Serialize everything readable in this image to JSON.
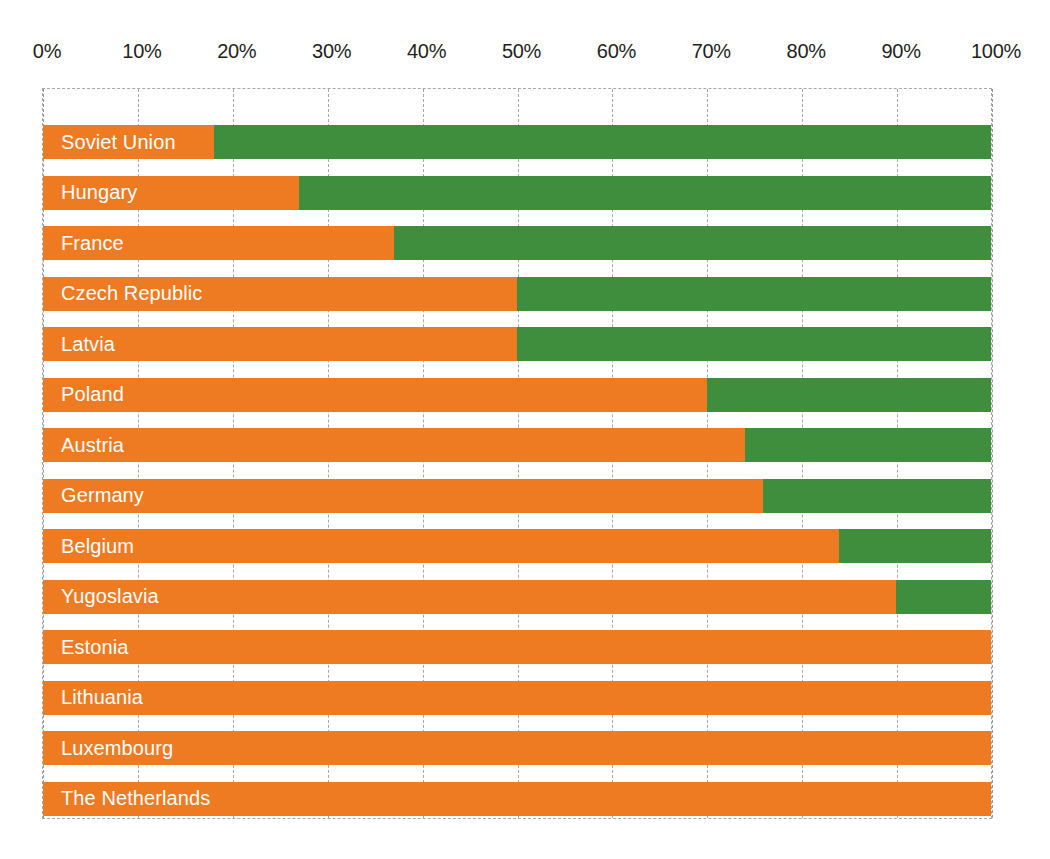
{
  "chart_data": {
    "type": "bar",
    "subtype": "stacked-horizontal-100-percent",
    "title": "",
    "subtitle": "",
    "xlabel": "",
    "ylabel": "",
    "xlim": [
      0,
      100
    ],
    "grid": true,
    "grid_axis": "x",
    "legend": false,
    "legend_position": "none",
    "orientation": "horizontal",
    "categories": [
      "Soviet Union",
      "Hungary",
      "France",
      "Czech Republic",
      "Latvia",
      "Poland",
      "Austria",
      "Germany",
      "Belgium",
      "Yugoslavia",
      "Estonia",
      "Lithuania",
      "Luxembourg",
      "The Netherlands"
    ],
    "series": [
      {
        "name": "Orange segment",
        "color": "#ee7b22",
        "values": [
          18,
          27,
          37,
          50,
          50,
          70,
          74,
          76,
          84,
          90,
          100,
          100,
          100,
          100
        ]
      },
      {
        "name": "Green segment",
        "color": "#3e8e3e",
        "values": [
          82,
          73,
          63,
          50,
          50,
          30,
          26,
          24,
          16,
          10,
          0,
          0,
          0,
          0
        ]
      }
    ],
    "xticks": [
      0,
      10,
      20,
      30,
      40,
      50,
      60,
      70,
      80,
      90,
      100
    ],
    "xticklabels": [
      "0%",
      "10%",
      "20%",
      "30%",
      "40%",
      "50%",
      "60%",
      "70%",
      "80%",
      "90%",
      "100%"
    ]
  },
  "colors": {
    "primary": "#ee7b22",
    "secondary": "#3e8e3e",
    "gridline": "#a8a8a8",
    "label_text": "#ffffff",
    "axis_text": "#231f20",
    "background": "#ffffff"
  }
}
